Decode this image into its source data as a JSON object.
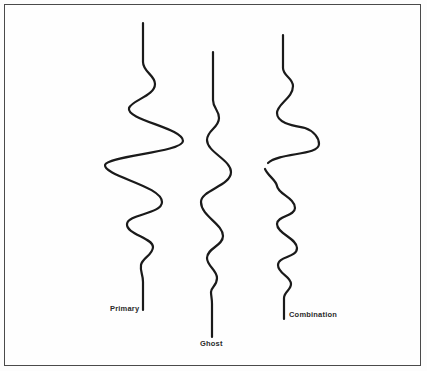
{
  "diagram": {
    "traces": [
      {
        "id": "primary",
        "label": "Primary"
      },
      {
        "id": "ghost",
        "label": "Ghost"
      },
      {
        "id": "combination",
        "label": "Combination"
      }
    ],
    "colors": {
      "stroke": "#1a1a1a",
      "frame": "#4a4a4a",
      "background": "#fefefe"
    }
  }
}
